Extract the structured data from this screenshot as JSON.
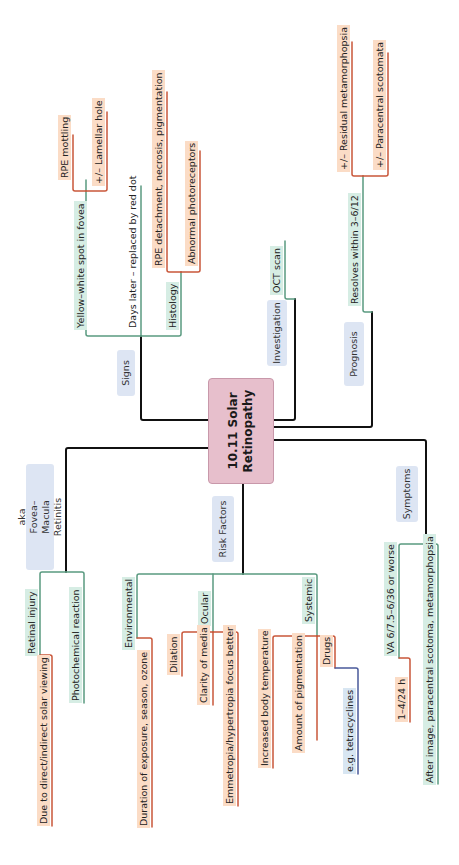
{
  "title": "10.11 Solar Retinopathy",
  "colors": {
    "center_fill": "#e7bfcc",
    "category_fill": "#dde5f3",
    "green_line": "#5a9a80",
    "orange_line": "#c9573a",
    "blue_line": "#4a5a9a",
    "trunk_line": "#111111"
  },
  "alias": "aka Fovea–Macula Retinitis",
  "branches": {
    "signs": {
      "label": "Signs",
      "items": {
        "yellow_white": "Yellow–white spot in fovea",
        "rpe_mottling": "RPE mottling",
        "lamellar_hole": "+/– Lamellar hole",
        "days_later": "Days later – replaced by red dot",
        "histology": "Histology",
        "rpe_detachment": "RPE detachment, necrosis, pigmentation",
        "abnormal_photoreceptors": "Abnormal photoreceptors"
      }
    },
    "investigation": {
      "label": "Investigation",
      "items": {
        "oct": "OCT scan"
      }
    },
    "prognosis": {
      "label": "Prognosis",
      "items": {
        "resolves": "Resolves within 3–6/12",
        "residual": "+/– Residual metamorphopsia",
        "paracentral": "+/– Paracentral scotomata"
      }
    },
    "definition": {
      "items": {
        "retinal_injury": "Retinal injury",
        "due_to": "Due to direct/indirect solar viewing",
        "photochemical": "Photochemical reaction"
      }
    },
    "risk_factors": {
      "label": "Risk Factors",
      "items": {
        "environmental": "Environmental",
        "duration": "Duration of exposure, season, ozone",
        "ocular": "Ocular",
        "dilation": "Dilation",
        "clarity": "Clarity of media",
        "emmetropia": "Emmetropia/hypertropia focus better",
        "systemic": "Systemic",
        "body_temp": "Increased body temperature",
        "pigmentation": "Amount of pigmentation",
        "drugs": "Drugs",
        "tetracyclines": "e.g. tetracyclines"
      }
    },
    "symptoms": {
      "label": "Symptoms",
      "items": {
        "va": "VA 6/7.5–6/36 or worse",
        "onset": "1–4/24 h",
        "after_image": "After image, paracentral scotoma, metamorphopsia"
      }
    }
  }
}
